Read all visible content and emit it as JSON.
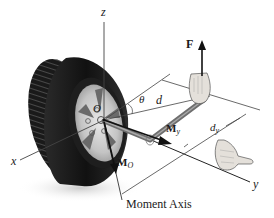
{
  "figure": {
    "colors": {
      "background": "#ffffff",
      "line": "#333333",
      "tire": "#1c1c1c",
      "rim": "#c8c8c8",
      "wrench": "#6e6e6e",
      "hand": "#e0dcd6"
    },
    "labels": {
      "z_axis": "z",
      "x_axis": "x",
      "y_axis": "y",
      "origin": "O",
      "angle": "θ",
      "distance": "d",
      "force": "F",
      "moment_y_main": "M",
      "moment_y_sub": "y",
      "moment_o_main": "M",
      "moment_o_sub": "O",
      "dist_y_main": "d",
      "dist_y_sub": "y",
      "moment_axis": "Moment Axis"
    },
    "icons": [
      "wheel-icon",
      "wrench-icon",
      "hand-icon",
      "force-arrow-icon",
      "moment-arrow-icon"
    ]
  }
}
